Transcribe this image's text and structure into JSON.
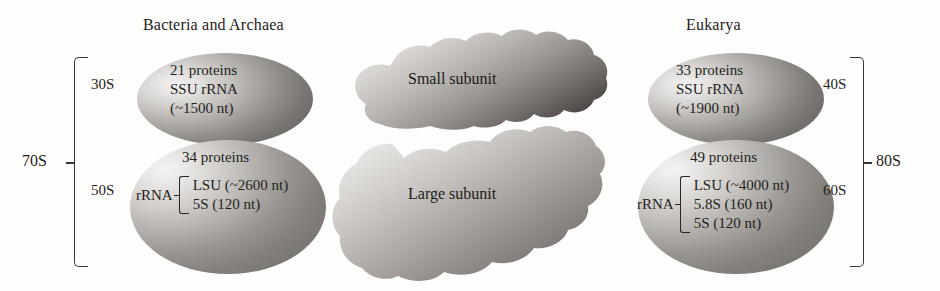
{
  "columns": {
    "left": {
      "heading": "Bacteria and Archaea",
      "total_label": "70S",
      "small_subunit": {
        "s_label": "30S",
        "proteins": "21 proteins",
        "rrna_name": "SSU rRNA",
        "rrna_length": "(~1500 nt)"
      },
      "large_subunit": {
        "s_label": "50S",
        "proteins": "34 proteins",
        "rrna_label": "rRNA",
        "rrna_items": [
          "LSU (~2600 nt)",
          "5S (120 nt)"
        ]
      }
    },
    "right": {
      "heading": "Eukarya",
      "total_label": "80S",
      "small_subunit": {
        "s_label": "40S",
        "proteins": "33 proteins",
        "rrna_name": "SSU rRNA",
        "rrna_length": "(~1900 nt)"
      },
      "large_subunit": {
        "s_label": "60S",
        "proteins": "49 proteins",
        "rrna_label": "rRNA",
        "rrna_items": [
          "LSU (~4000 nt)",
          "5.8S (160 nt)",
          "5S (120 nt)"
        ]
      }
    }
  },
  "center": {
    "small_subunit_label": "Small subunit",
    "large_subunit_label": "Large subunit"
  },
  "colors": {
    "background": "#fdfdfc",
    "text": "#221f1d",
    "rule": "#3a3634",
    "subunit_light": "#f3f2f1",
    "subunit_dark": "#676361"
  }
}
